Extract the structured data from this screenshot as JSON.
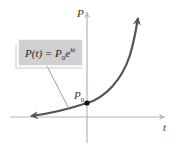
{
  "figure": {
    "y_axis_label": "P",
    "x_axis_label": "t",
    "intercept_label": "P",
    "intercept_subscript": "0",
    "formula": {
      "lhs": "P(t) = P",
      "subscript": "0",
      "base": "e",
      "exponent": "kt"
    }
  },
  "colors": {
    "axis": "#b5b5b5",
    "curve": "#555555",
    "box_fill": "#d0d0d0",
    "box_border": "#c8c8c8",
    "leader": "#888888",
    "dot": "#111111"
  }
}
